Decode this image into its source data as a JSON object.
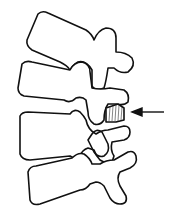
{
  "diagram": {
    "elements": [
      {
        "id": "vertebra-1",
        "type": "vertebra-outline"
      },
      {
        "id": "vertebra-2",
        "type": "vertebra-outline"
      },
      {
        "id": "vertebra-3",
        "type": "vertebra-outline"
      },
      {
        "id": "vertebra-4",
        "type": "vertebra-outline"
      },
      {
        "id": "pars-defect",
        "type": "hatched-region"
      },
      {
        "id": "pointer-arrow",
        "type": "arrow",
        "direction": "left"
      }
    ],
    "colors": {
      "line": "#111111",
      "background": "#ffffff"
    }
  }
}
